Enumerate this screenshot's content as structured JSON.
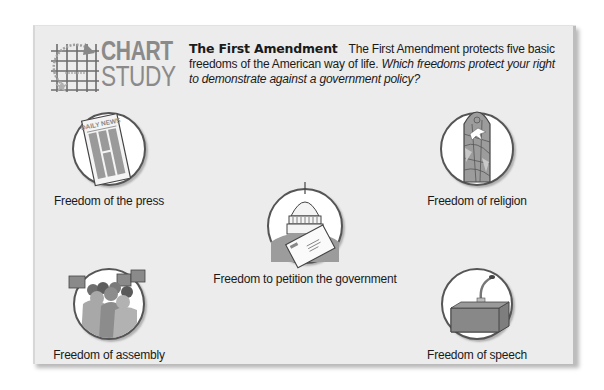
{
  "logo": {
    "line1": "CHART",
    "line2": "STUDY",
    "icon": "chart-grid-icon"
  },
  "intro": {
    "title": "The First Amendment",
    "body": "The First Amendment protects five basic freedoms of the American way of life.",
    "question": "Which freedoms protect your right to demonstrate against a government policy?"
  },
  "freedoms": [
    {
      "label": "Freedom of the press",
      "icon": "newspaper-icon",
      "icon_text": "DAILY NEWS"
    },
    {
      "label": "Freedom of religion",
      "icon": "stained-glass-window-icon"
    },
    {
      "label": "Freedom to petition the government",
      "icon": "capitol-letter-icon"
    },
    {
      "label": "Freedom of assembly",
      "icon": "crowd-with-signs-icon"
    },
    {
      "label": "Freedom of speech",
      "icon": "podium-microphone-icon"
    }
  ],
  "colors": {
    "card_background": "#ececec",
    "logo_gray": "#8a8a8a",
    "icon_fill_gray": "#8f8f8f",
    "text": "#1a1a1a"
  }
}
